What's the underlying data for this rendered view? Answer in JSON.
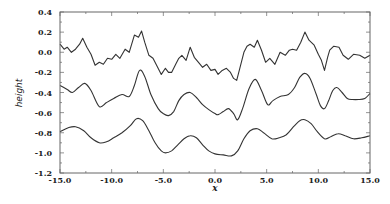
{
  "chart_data": {
    "type": "line",
    "title": "",
    "xlabel": "x",
    "ylabel": "height",
    "xlim": [
      -15.0,
      15.0
    ],
    "ylim": [
      -1.2,
      0.4
    ],
    "grid": false,
    "legend": null,
    "x_ticks": [
      "-15.0",
      "-10.0",
      "-5.0",
      "0.0",
      "5.0",
      "10.0",
      "15.0"
    ],
    "x_tick_values": [
      -15,
      -10,
      -5,
      0,
      5,
      10,
      15
    ],
    "y_ticks": [
      "0.4",
      "0.2",
      "0.0",
      "-0.2",
      "-0.4",
      "-0.6",
      "-0.8",
      "-1.0",
      "-1.2"
    ],
    "y_tick_values": [
      0.4,
      0.2,
      0.0,
      -0.2,
      -0.4,
      -0.6,
      -0.8,
      -1.0,
      -1.2
    ],
    "series": [
      {
        "name": "rough surface (top)",
        "x": [
          -15,
          -14.6,
          -14.3,
          -13.9,
          -13.5,
          -13.1,
          -12.8,
          -12.4,
          -12.0,
          -11.6,
          -11.2,
          -10.8,
          -10.4,
          -10.0,
          -9.6,
          -9.2,
          -8.7,
          -8.3,
          -7.8,
          -7.4,
          -7.1,
          -6.8,
          -6.4,
          -6.0,
          -5.6,
          -5.2,
          -4.8,
          -4.5,
          -4.2,
          -3.8,
          -3.5,
          -3.2,
          -2.8,
          -2.4,
          -2.0,
          -1.6,
          -1.2,
          -0.8,
          -0.4,
          0.0,
          0.3,
          0.7,
          1.1,
          1.5,
          1.8,
          2.1,
          2.4,
          2.8,
          3.1,
          3.4,
          3.8,
          4.1,
          4.5,
          4.9,
          5.3,
          5.8,
          6.3,
          6.8,
          7.2,
          7.5,
          7.9,
          8.3,
          8.7,
          9.1,
          9.6,
          10.0,
          10.3,
          10.6,
          10.9,
          11.1,
          11.5,
          12.0,
          12.4,
          12.9,
          13.4,
          14.0,
          14.5,
          15.0
        ],
        "values": [
          0.08,
          0.03,
          0.05,
          0.0,
          0.03,
          0.08,
          0.14,
          0.05,
          -0.02,
          -0.13,
          -0.1,
          -0.12,
          -0.06,
          -0.07,
          -0.02,
          -0.06,
          0.03,
          0.0,
          0.17,
          0.15,
          0.21,
          0.1,
          -0.03,
          -0.06,
          -0.14,
          -0.22,
          -0.16,
          -0.2,
          -0.2,
          -0.12,
          -0.06,
          -0.03,
          -0.08,
          0.05,
          -0.05,
          -0.1,
          -0.15,
          -0.12,
          -0.18,
          -0.17,
          -0.22,
          -0.18,
          -0.16,
          -0.2,
          -0.26,
          -0.28,
          -0.16,
          0.0,
          0.06,
          0.08,
          0.05,
          0.12,
          0.02,
          -0.1,
          -0.06,
          -0.12,
          0.0,
          -0.03,
          0.02,
          0.03,
          0.02,
          0.1,
          0.2,
          0.12,
          0.07,
          -0.02,
          -0.08,
          -0.18,
          -0.05,
          0.02,
          0.06,
          0.05,
          -0.03,
          -0.07,
          -0.02,
          -0.03,
          -0.06,
          -0.03
        ]
      },
      {
        "name": "smoothed surface (middle)",
        "x": [
          -15,
          -14.3,
          -13.8,
          -13.2,
          -12.6,
          -12.0,
          -11.2,
          -10.5,
          -9.8,
          -9.0,
          -8.3,
          -7.8,
          -7.3,
          -6.8,
          -6.2,
          -5.5,
          -5.0,
          -4.5,
          -4.0,
          -3.5,
          -3.0,
          -2.4,
          -1.8,
          -1.2,
          -0.6,
          0.0,
          0.3,
          0.8,
          1.3,
          1.8,
          2.2,
          2.7,
          3.3,
          3.9,
          4.5,
          5.1,
          5.6,
          6.3,
          7.1,
          7.7,
          8.2,
          8.7,
          9.2,
          9.8,
          10.2,
          10.6,
          11.0,
          11.4,
          11.8,
          12.3,
          12.8,
          13.3,
          13.9,
          14.5,
          15.0
        ],
        "values": [
          -0.33,
          -0.37,
          -0.4,
          -0.35,
          -0.31,
          -0.38,
          -0.54,
          -0.5,
          -0.46,
          -0.42,
          -0.44,
          -0.33,
          -0.18,
          -0.24,
          -0.42,
          -0.56,
          -0.61,
          -0.63,
          -0.59,
          -0.48,
          -0.42,
          -0.4,
          -0.45,
          -0.52,
          -0.57,
          -0.61,
          -0.62,
          -0.59,
          -0.56,
          -0.61,
          -0.67,
          -0.55,
          -0.36,
          -0.27,
          -0.38,
          -0.52,
          -0.48,
          -0.44,
          -0.42,
          -0.35,
          -0.25,
          -0.21,
          -0.26,
          -0.42,
          -0.53,
          -0.56,
          -0.48,
          -0.38,
          -0.35,
          -0.4,
          -0.46,
          -0.47,
          -0.47,
          -0.46,
          -0.41
        ]
      },
      {
        "name": "mean surface (bottom)",
        "x": [
          -15,
          -14.2,
          -13.5,
          -12.7,
          -12.0,
          -11.2,
          -10.5,
          -9.8,
          -9.0,
          -8.2,
          -7.6,
          -7.0,
          -6.4,
          -5.8,
          -5.2,
          -4.8,
          -4.2,
          -3.6,
          -3.0,
          -2.4,
          -1.8,
          -1.2,
          -0.6,
          0.0,
          0.8,
          1.6,
          2.2,
          2.8,
          3.4,
          4.1,
          4.7,
          5.5,
          6.2,
          6.9,
          7.6,
          8.2,
          8.7,
          9.3,
          9.9,
          10.6,
          11.2,
          11.9,
          12.6,
          13.4,
          14.2,
          15.0
        ],
        "values": [
          -0.79,
          -0.75,
          -0.74,
          -0.78,
          -0.85,
          -0.9,
          -0.89,
          -0.85,
          -0.8,
          -0.73,
          -0.66,
          -0.68,
          -0.78,
          -0.9,
          -0.98,
          -1.0,
          -0.98,
          -0.92,
          -0.86,
          -0.83,
          -0.85,
          -0.92,
          -0.98,
          -1.01,
          -1.02,
          -1.03,
          -0.98,
          -0.86,
          -0.78,
          -0.76,
          -0.8,
          -0.86,
          -0.85,
          -0.82,
          -0.74,
          -0.68,
          -0.67,
          -0.71,
          -0.79,
          -0.86,
          -0.84,
          -0.81,
          -0.83,
          -0.86,
          -0.85,
          -0.83
        ]
      }
    ]
  },
  "plot_area": {
    "left": 60,
    "top": 12,
    "right": 370,
    "bottom": 173
  },
  "colors": {
    "line": "#333333",
    "frame": "#666666",
    "text": "#222222",
    "background": "#ffffff"
  }
}
